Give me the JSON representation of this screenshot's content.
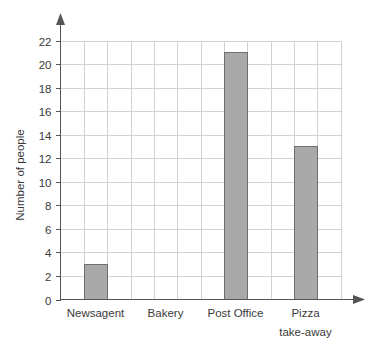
{
  "chart_data": {
    "type": "bar",
    "title": "",
    "xlabel": "",
    "ylabel": "Number of people",
    "categories": [
      "Newsagent",
      "Bakery",
      "Post Office",
      "Pizza take-away"
    ],
    "category_lines": [
      [
        "Newsagent"
      ],
      [
        "Bakery"
      ],
      [
        "Post Office"
      ],
      [
        "Pizza",
        "take-away"
      ]
    ],
    "values": [
      3,
      0,
      21,
      13
    ],
    "ylim": [
      0,
      22
    ],
    "ytick_step": 2,
    "yticks": [
      0,
      2,
      4,
      6,
      8,
      10,
      12,
      14,
      16,
      18,
      20,
      22
    ],
    "ytick_labels": [
      "0",
      "2",
      "4",
      "6",
      "8",
      "10",
      "12",
      "14",
      "16",
      "18",
      "20",
      "22"
    ],
    "grid": true,
    "grid_color": "#d2d2d2",
    "grid_columns": 12,
    "legend": false,
    "legend_position": "none",
    "bar_color": "#a9a9a9",
    "bar_edge_color": "#6e6e6e",
    "axis_color": "#555555",
    "background_color": "#ffffff",
    "y_axis_arrow": true,
    "x_axis_arrow": true
  }
}
